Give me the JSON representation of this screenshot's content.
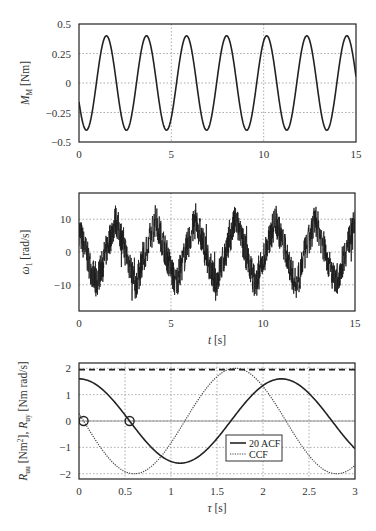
{
  "chart_data": [
    {
      "type": "line",
      "title": "",
      "xlabel": "",
      "ylabel": "M_M [Nm]",
      "ylabel_main": "M",
      "ylabel_sub": "M",
      "ylabel_unit": "[Nm]",
      "xlim": [
        0,
        15
      ],
      "ylim": [
        -0.5,
        0.5
      ],
      "xticks": [
        0,
        5,
        10,
        15
      ],
      "xtick_labels": [
        "0",
        "5",
        "10",
        "15"
      ],
      "yticks": [
        -0.5,
        -0.25,
        0,
        0.25,
        0.5
      ],
      "ytick_labels": [
        "−0.5",
        "−0.25",
        "0",
        "0.25",
        "0.5"
      ],
      "grid": true,
      "series": [
        {
          "name": "M_M",
          "style": "solid",
          "amplitude": 0.4,
          "period": 2.17,
          "phase_t0": -0.25,
          "x": [
            0,
            0.4,
            1.5,
            2.6,
            3.6,
            4.7,
            5.8,
            6.9,
            8.0,
            9.0,
            10.1,
            11.2,
            12.3,
            13.4,
            14.5,
            15
          ],
          "y": [
            -0.25,
            -0.4,
            0.4,
            -0.4,
            0.4,
            -0.4,
            0.4,
            -0.4,
            0.4,
            -0.4,
            0.4,
            -0.4,
            0.4,
            -0.4,
            0.4,
            0.0
          ]
        }
      ]
    },
    {
      "type": "line",
      "title": "",
      "xlabel": "t [s]",
      "xlabel_main": "t",
      "xlabel_unit": "[s]",
      "ylabel": "ω_1 [rad/s]",
      "ylabel_main": "ω",
      "ylabel_sub": "1",
      "ylabel_unit": "[rad/s]",
      "xlim": [
        0,
        15
      ],
      "ylim": [
        -18,
        18
      ],
      "xticks": [
        0,
        5,
        10,
        15
      ],
      "xtick_labels": [
        "0",
        "5",
        "10",
        "15"
      ],
      "yticks": [
        -10,
        0,
        10
      ],
      "ytick_labels": [
        "−10",
        "0",
        "10"
      ],
      "grid": true,
      "series": [
        {
          "name": "omega_1",
          "style": "solid-noisy",
          "base_amplitude": 10,
          "period": 2.17,
          "noise_amplitude": 5,
          "x": [
            0,
            0.9,
            2.0,
            3.0,
            4.1,
            5.1,
            6.2,
            7.3,
            8.4,
            9.4,
            10.5,
            11.6,
            12.7,
            13.8,
            15
          ],
          "y": [
            5,
            -10,
            10,
            -10,
            10,
            -10,
            12,
            -12,
            10,
            -10,
            10,
            -10,
            10,
            -11,
            10
          ]
        }
      ]
    },
    {
      "type": "line",
      "title": "",
      "xlabel": "τ [s]",
      "xlabel_main": "τ",
      "xlabel_unit": "[s]",
      "ylabel": "R_uu [Nm²], R_uy [Nm rad/s]",
      "ylabel_part1": "R",
      "ylabel_sub1": "uu",
      "ylabel_unit1": " [Nm",
      "ylabel_sup1": "2",
      "ylabel_close1": "], ",
      "ylabel_part2": "R",
      "ylabel_sub2": "uy",
      "ylabel_unit2": " [Nm rad/s]",
      "xlim": [
        0,
        3
      ],
      "ylim": [
        -2.2,
        2.2
      ],
      "xticks": [
        0,
        0.5,
        1,
        1.5,
        2,
        2.5,
        3
      ],
      "xtick_labels": [
        "0",
        "0.5",
        "1",
        "1.5",
        "2",
        "2.5",
        "3"
      ],
      "yticks": [
        -2,
        -1,
        0,
        1,
        2
      ],
      "ytick_labels": [
        "−2",
        "−1",
        "0",
        "1",
        "2"
      ],
      "grid": true,
      "legend": {
        "position": "lower-center-right",
        "entries": [
          "20 ACF",
          "CCF"
        ]
      },
      "series": [
        {
          "name": "20 ACF",
          "style": "solid",
          "amplitude": 1.6,
          "period": 2.2,
          "x": [
            0,
            0.55,
            1.1,
            1.65,
            2.2,
            3.0
          ],
          "y": [
            1.6,
            0.0,
            -1.6,
            0.0,
            1.6,
            -1.25
          ]
        },
        {
          "name": "CCF",
          "style": "dotted",
          "amplitude": 2.0,
          "period": 2.2,
          "x": [
            0,
            0.05,
            0.6,
            1.15,
            1.7,
            2.25,
            2.8,
            3.0
          ],
          "y": [
            0.3,
            0.0,
            -2.0,
            0.0,
            2.0,
            0.0,
            -2.0,
            -1.7
          ]
        },
        {
          "name": "reference level",
          "style": "dashed",
          "x": [
            0,
            3
          ],
          "y": [
            1.95,
            1.95
          ]
        }
      ],
      "annotations": [
        {
          "type": "circle-marker",
          "x": 0.05,
          "y": 0.0
        },
        {
          "type": "circle-marker",
          "x": 0.55,
          "y": 0.0
        }
      ]
    }
  ]
}
